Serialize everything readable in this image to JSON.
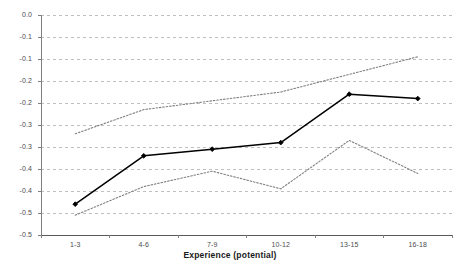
{
  "chart_data": {
    "type": "line",
    "title": "",
    "xlabel": "Experience (potential)",
    "ylabel": "",
    "categories": [
      "1-3",
      "4-6",
      "7-9",
      "10-12",
      "13-15",
      "16-18"
    ],
    "ylim": [
      -0.5,
      0.0
    ],
    "ytick_values": [
      0.0,
      -0.05,
      -0.1,
      -0.15,
      -0.2,
      -0.25,
      -0.3,
      -0.35,
      -0.4,
      -0.45,
      -0.5
    ],
    "ytick_labels": [
      "0.0",
      "-0.1",
      "-0.1",
      "-0.2",
      "-0.2",
      "-0.3",
      "-0.3",
      "-0.4",
      "-0.4",
      "-0.5",
      "-0.5"
    ],
    "grid": true,
    "legend": "none",
    "series": [
      {
        "name": "estimate",
        "style": "solid",
        "marker": "diamond",
        "color": "#000000",
        "values": [
          -0.43,
          -0.32,
          -0.305,
          -0.29,
          -0.18,
          -0.19
        ]
      },
      {
        "name": "upper-confidence-band",
        "style": "dotted",
        "marker": "none",
        "color": "#808080",
        "values": [
          -0.27,
          -0.215,
          -0.195,
          -0.175,
          -0.135,
          -0.095
        ]
      },
      {
        "name": "lower-confidence-band",
        "style": "dotted",
        "marker": "none",
        "color": "#808080",
        "values": [
          -0.455,
          -0.39,
          -0.355,
          -0.395,
          -0.285,
          -0.36
        ]
      }
    ]
  },
  "axes": {
    "x_title": "Experience (potential)"
  }
}
